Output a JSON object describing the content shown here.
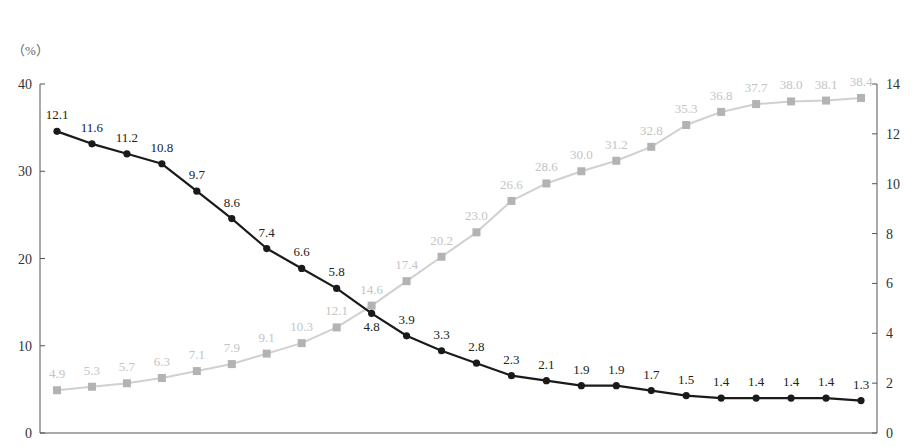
{
  "chart_data": {
    "type": "line",
    "title": "",
    "unit_label_left": "（%）",
    "xlabel": "",
    "ylabel_left": "%",
    "ylabel_right": "",
    "ylim_left": [
      0,
      40
    ],
    "ylim_right": [
      0,
      14
    ],
    "yticks_left": [
      0,
      10,
      20,
      30,
      40
    ],
    "yticks_right": [
      0,
      2,
      4,
      6,
      8,
      10,
      12,
      14
    ],
    "grid": false,
    "legend": null,
    "x": [
      1,
      2,
      3,
      4,
      5,
      6,
      7,
      8,
      9,
      10,
      11,
      12,
      13,
      14,
      15,
      16,
      17,
      18,
      19,
      20,
      21,
      22,
      23,
      24
    ],
    "series": [
      {
        "name": "series-gray",
        "axis": "left",
        "marker": "square",
        "color": "#b3b3b3",
        "label_color": "#c4c4c4",
        "values": [
          4.9,
          5.3,
          5.7,
          6.3,
          7.1,
          7.9,
          9.1,
          10.3,
          12.1,
          14.6,
          17.4,
          20.2,
          23.0,
          26.6,
          28.6,
          30.0,
          31.2,
          32.8,
          35.3,
          36.8,
          37.7,
          38.0,
          38.1,
          38.4
        ]
      },
      {
        "name": "series-black",
        "axis": "right",
        "marker": "circle",
        "color": "#1a1a1a",
        "label_color": "#222222",
        "values": [
          12.1,
          11.6,
          11.2,
          10.8,
          9.7,
          8.6,
          7.4,
          6.6,
          5.8,
          4.8,
          3.9,
          3.3,
          2.8,
          2.3,
          2.1,
          1.9,
          1.9,
          1.7,
          1.5,
          1.4,
          1.4,
          1.4,
          1.4,
          1.3
        ]
      }
    ]
  }
}
